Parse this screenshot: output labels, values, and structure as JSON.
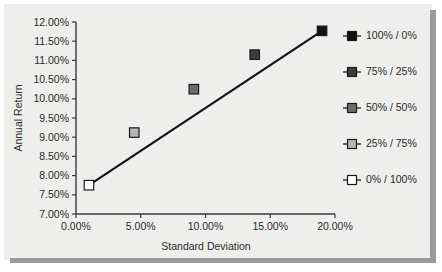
{
  "chart_data": {
    "type": "scatter",
    "title": "",
    "xlabel": "Standard Deviation",
    "ylabel": "Annual Return",
    "xlim": [
      0,
      20
    ],
    "ylim": [
      7.0,
      12.0
    ],
    "grid": false,
    "legend_position": "right",
    "x_tick_labels": [
      "0.00%",
      "5.00%",
      "10.00%",
      "15.00%",
      "20.00%"
    ],
    "x_tick_values": [
      0,
      5,
      10,
      15,
      20
    ],
    "y_tick_labels": [
      "12.00%",
      "11.50%",
      "11.00%",
      "10.50%",
      "10.00%",
      "9.50%",
      "9.00%",
      "8.50%",
      "8.00%",
      "7.50%",
      "7.00%"
    ],
    "y_tick_values": [
      12.0,
      11.5,
      11.0,
      10.5,
      10.0,
      9.5,
      9.0,
      8.5,
      8.0,
      7.5,
      7.0
    ],
    "points": [
      {
        "name": "100% / 0%",
        "x": 19.0,
        "y": 11.77,
        "color": "#111111"
      },
      {
        "name": "75% / 25%",
        "x": 13.8,
        "y": 11.15,
        "color": "#3d3d3d"
      },
      {
        "name": "50% / 50%",
        "x": 9.1,
        "y": 10.25,
        "color": "#6e6e6e"
      },
      {
        "name": "25% / 75%",
        "x": 4.5,
        "y": 9.12,
        "color": "#b5b5b5"
      },
      {
        "name": "0% / 100%",
        "x": 1.0,
        "y": 7.75,
        "color": "#ffffff"
      }
    ],
    "trendline": {
      "x": [
        1.0,
        19.0
      ],
      "y": [
        7.75,
        11.77
      ]
    },
    "legend": [
      {
        "label": "100% / 0%",
        "color": "#111111"
      },
      {
        "label": "75% / 25%",
        "color": "#3d3d3d"
      },
      {
        "label": "50% / 50%",
        "color": "#6e6e6e"
      },
      {
        "label": "25% / 75%",
        "color": "#b5b5b5"
      },
      {
        "label": "0% / 100%",
        "color": "#ffffff"
      }
    ]
  },
  "colors": {
    "background": "#eeeeec",
    "axis": "#3a3a3a",
    "line": "#111111",
    "shadow": "#9a9a9a"
  }
}
